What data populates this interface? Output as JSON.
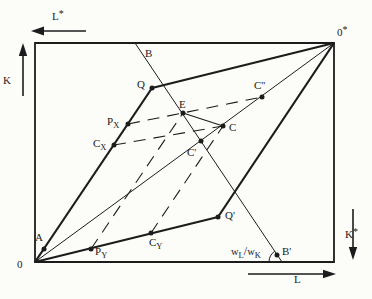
{
  "figure": {
    "type": "edgeworth-box-factor-allocation-diagram",
    "ink_color": "#1c1c1c",
    "paper_color": "#fcfcf9",
    "axis_labels": {
      "top": {
        "main": "L",
        "sup": "*"
      },
      "left": {
        "main": "K"
      },
      "right": {
        "main": "K",
        "sup": "*"
      },
      "bottom": {
        "main": "L"
      }
    },
    "origin_labels": {
      "bottom_left": {
        "main": "0"
      },
      "top_right": {
        "main": "0",
        "sup": "*"
      }
    },
    "point_labels": {
      "b": {
        "main": "B"
      },
      "q": {
        "main": "Q"
      },
      "c_dprime": {
        "main": "C''"
      },
      "e": {
        "main": "E"
      },
      "p_x": {
        "main": "P",
        "sub": "X"
      },
      "c": {
        "main": "C"
      },
      "c_x": {
        "main": "C",
        "sub": "X"
      },
      "c_prime": {
        "main": "C'"
      },
      "q_prime": {
        "main": "Q'"
      },
      "a": {
        "main": "A"
      },
      "p_y": {
        "main": "P",
        "sub": "Y"
      },
      "c_y": {
        "main": "C",
        "sub": "Y"
      },
      "b_prime": {
        "main": "B'"
      }
    },
    "wage_ratio_label": {
      "num": "w",
      "num_sub": "L",
      "divider": "/",
      "den": "w",
      "den_sub": "K"
    }
  }
}
